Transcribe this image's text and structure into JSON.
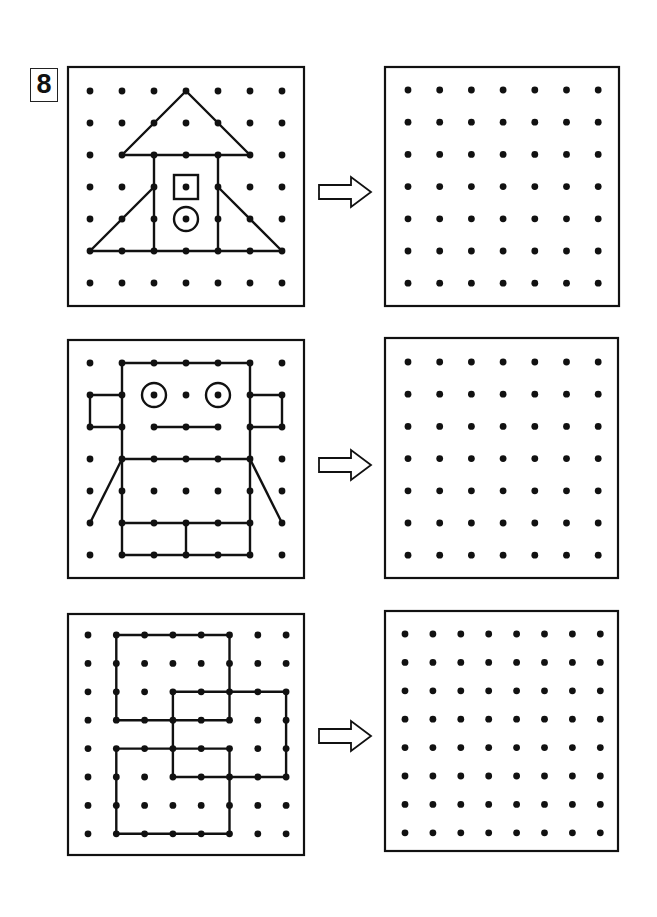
{
  "worksheet": {
    "exercise_number": "8",
    "colors": {
      "ink": "#111111",
      "paper": "#ffffff"
    }
  },
  "rows": [
    {
      "name": "rocket-house",
      "source": {
        "box": [
          68,
          67,
          236,
          239
        ],
        "grid": {
          "cols": 7,
          "rows": 7,
          "x0": 90,
          "y0": 91,
          "dx": 32,
          "dy": 32
        },
        "shape": {
          "polylines": [
            [
              [
                0,
                5
              ],
              [
                6,
                5
              ],
              [
                4,
                3
              ]
            ],
            [
              [
                0,
                5
              ],
              [
                2,
                3
              ]
            ],
            [
              [
                1,
                2
              ],
              [
                3,
                0
              ],
              [
                5,
                2
              ],
              [
                1,
                2
              ]
            ],
            [
              [
                2,
                2
              ],
              [
                2,
                5
              ]
            ],
            [
              [
                4,
                2
              ],
              [
                4,
                5
              ]
            ]
          ],
          "squares": [
            [
              3,
              3
            ]
          ],
          "circles": [
            [
              3,
              4
            ]
          ]
        }
      },
      "arrow": {
        "x": 319,
        "y": 179
      },
      "target": {
        "box": [
          385,
          67,
          234,
          239
        ],
        "grid": {
          "cols": 7,
          "rows": 7,
          "x0": 408,
          "y0": 90,
          "dx": 31.7,
          "dy": 32.2
        }
      }
    },
    {
      "name": "robot",
      "source": {
        "box": [
          68,
          340,
          236,
          238
        ],
        "grid": {
          "cols": 7,
          "rows": 7,
          "x0": 90,
          "y0": 363,
          "dx": 32,
          "dy": 32
        },
        "shape": {
          "polylines": [
            [
              [
                1,
                0
              ],
              [
                5,
                0
              ],
              [
                5,
                6
              ],
              [
                1,
                6
              ],
              [
                1,
                0
              ]
            ],
            [
              [
                1,
                1
              ],
              [
                0,
                1
              ],
              [
                0,
                2
              ],
              [
                1,
                2
              ]
            ],
            [
              [
                5,
                1
              ],
              [
                6,
                1
              ],
              [
                6,
                2
              ],
              [
                5,
                2
              ]
            ],
            [
              [
                2,
                2
              ],
              [
                4,
                2
              ]
            ],
            [
              [
                1,
                3
              ],
              [
                5,
                3
              ]
            ],
            [
              [
                1,
                5
              ],
              [
                5,
                5
              ]
            ],
            [
              [
                3,
                5
              ],
              [
                3,
                6
              ]
            ],
            [
              [
                1,
                3
              ],
              [
                0,
                5
              ]
            ],
            [
              [
                5,
                3
              ],
              [
                6,
                5
              ]
            ]
          ],
          "squares": [],
          "circles": [
            [
              2,
              1
            ],
            [
              4,
              1
            ]
          ]
        }
      },
      "arrow": {
        "x": 319,
        "y": 452
      },
      "target": {
        "box": [
          385,
          338,
          233,
          240
        ],
        "grid": {
          "cols": 7,
          "rows": 7,
          "x0": 408,
          "y0": 362,
          "dx": 31.7,
          "dy": 32.2
        }
      }
    },
    {
      "name": "overlapping-squares",
      "source": {
        "box": [
          68,
          614,
          236,
          241
        ],
        "grid": {
          "cols": 8,
          "rows": 8,
          "x0": 88,
          "y0": 635,
          "dx": 28.3,
          "dy": 28.4
        },
        "shape": {
          "polylines": [
            [
              [
                1,
                0
              ],
              [
                5,
                0
              ],
              [
                5,
                3
              ],
              [
                1,
                3
              ],
              [
                1,
                0
              ]
            ],
            [
              [
                3,
                2
              ],
              [
                7,
                2
              ],
              [
                7,
                5
              ],
              [
                3,
                5
              ],
              [
                3,
                2
              ]
            ],
            [
              [
                1,
                4
              ],
              [
                5,
                4
              ],
              [
                5,
                7
              ],
              [
                1,
                7
              ],
              [
                1,
                4
              ]
            ]
          ],
          "squares": [],
          "circles": []
        }
      },
      "arrow": {
        "x": 319,
        "y": 723
      },
      "target": {
        "box": [
          385,
          611,
          233,
          240
        ],
        "grid": {
          "cols": 8,
          "rows": 8,
          "x0": 405,
          "y0": 634,
          "dx": 27.9,
          "dy": 28.4
        }
      }
    }
  ]
}
